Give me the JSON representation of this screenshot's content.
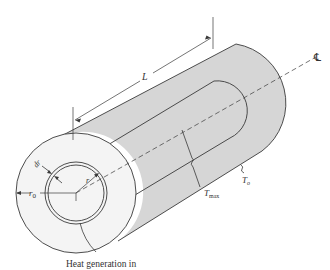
{
  "figure": {
    "colors": {
      "shell_fill": "#d6d6d6",
      "end_face_fill": "#f4f4f4",
      "line": "#3a3a3a",
      "text": "#333333"
    },
    "labels": {
      "length": "L",
      "centerline": "℄",
      "shell_thickness": "dr",
      "radius": "r",
      "outer_radius": "r",
      "outer_radius_sub": "0",
      "max_temp": "T",
      "max_temp_sub": "max",
      "surface_temp": "T",
      "surface_temp_sub": "o",
      "caption": "Heat generation in"
    }
  }
}
